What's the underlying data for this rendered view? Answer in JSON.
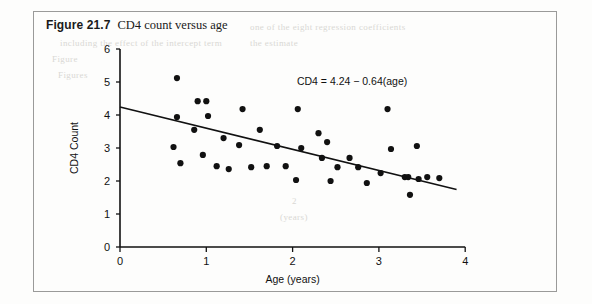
{
  "caption": {
    "figure_number": "Figure 21.7",
    "title": "CD4 count versus age"
  },
  "ghost_text": [
    {
      "text": "one of the eight regression coefficients",
      "x": 250,
      "y": 22
    },
    {
      "text": "including the effect of the intercept term",
      "x": 60,
      "y": 38
    },
    {
      "text": "Figure",
      "x": 52,
      "y": 54
    },
    {
      "text": "the estimate",
      "x": 250,
      "y": 38
    },
    {
      "text": "Figures",
      "x": 58,
      "y": 70
    },
    {
      "text": "2",
      "x": 292,
      "y": 196
    },
    {
      "text": "(years)",
      "x": 280,
      "y": 212
    }
  ],
  "chart_data": {
    "type": "scatter",
    "title": "",
    "xlabel": "Age (years)",
    "ylabel": "CD4 Count",
    "xlim": [
      0,
      4
    ],
    "ylim": [
      0,
      6
    ],
    "xticks": [
      0,
      1,
      2,
      3,
      4
    ],
    "yticks": [
      0,
      1,
      2,
      3,
      4,
      5,
      6
    ],
    "grid": false,
    "legend": null,
    "annotation": "CD4 = 4.24 − 0.64(age)",
    "annotation_xy": [
      2.05,
      4.9
    ],
    "fit_line": {
      "intercept": 4.24,
      "slope": -0.64,
      "x_start": 0.0,
      "x_end": 3.9
    },
    "points": [
      [
        0.66,
        5.12
      ],
      [
        0.66,
        3.94
      ],
      [
        0.62,
        3.03
      ],
      [
        0.7,
        2.54
      ],
      [
        0.9,
        4.42
      ],
      [
        0.86,
        3.55
      ],
      [
        1.0,
        4.42
      ],
      [
        1.02,
        3.97
      ],
      [
        0.96,
        2.79
      ],
      [
        1.12,
        2.45
      ],
      [
        1.2,
        3.3
      ],
      [
        1.26,
        2.36
      ],
      [
        1.42,
        4.18
      ],
      [
        1.38,
        3.09
      ],
      [
        1.52,
        2.42
      ],
      [
        1.62,
        3.55
      ],
      [
        1.7,
        2.45
      ],
      [
        1.82,
        3.06
      ],
      [
        1.92,
        2.45
      ],
      [
        2.06,
        4.18
      ],
      [
        2.1,
        3.0
      ],
      [
        2.04,
        2.03
      ],
      [
        2.3,
        3.45
      ],
      [
        2.34,
        2.7
      ],
      [
        2.4,
        3.18
      ],
      [
        2.52,
        2.42
      ],
      [
        2.44,
        2.0
      ],
      [
        2.66,
        2.7
      ],
      [
        2.76,
        2.42
      ],
      [
        2.86,
        1.94
      ],
      [
        3.1,
        4.18
      ],
      [
        3.14,
        2.97
      ],
      [
        3.02,
        2.24
      ],
      [
        3.3,
        2.12
      ],
      [
        3.34,
        2.12
      ],
      [
        3.36,
        1.58
      ],
      [
        3.46,
        2.06
      ],
      [
        3.44,
        3.06
      ],
      [
        3.56,
        2.12
      ],
      [
        3.7,
        2.09
      ]
    ]
  }
}
